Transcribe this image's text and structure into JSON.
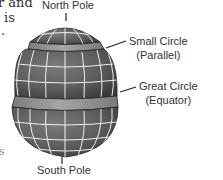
{
  "background_text": {
    "line1": "r and",
    "line2": "is",
    "line3": ".",
    "line4": "s"
  },
  "labels": {
    "north_pole": "North Pole",
    "south_pole": "South Pole",
    "small_circle": "Small Circle",
    "small_circle_sub": "(Parallel)",
    "great_circle": "Great Circle",
    "great_circle_sub": "(Equator)"
  },
  "colors": {
    "globe_dark": "#5a5a5a",
    "globe_band": "#9a9a9a",
    "grid": "#ffffff",
    "text": "#333333"
  }
}
